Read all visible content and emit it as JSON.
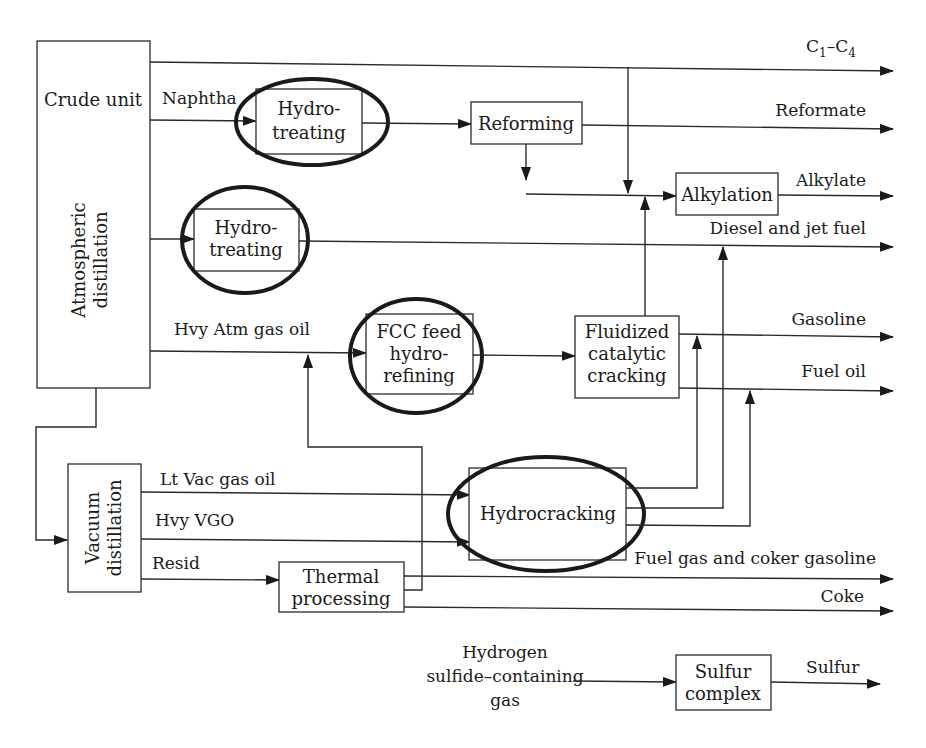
{
  "diagram": {
    "units": {
      "crude_unit": {
        "label": "Crude unit"
      },
      "atmospheric_distillation": {
        "label_line1": "Atmospheric",
        "label_line2": "distillation"
      },
      "naphtha_hydrotreating": {
        "label_line1": "Hydro-",
        "label_line2": "treating",
        "highlighted": true
      },
      "distillate_hydrotreating": {
        "label_line1": "Hydro-",
        "label_line2": "treating",
        "highlighted": true
      },
      "reforming": {
        "label": "Reforming"
      },
      "alkylation": {
        "label": "Alkylation"
      },
      "fcc_feed_hydrorefining": {
        "label_line1": "FCC feed",
        "label_line2": "hydro-",
        "label_line3": "refining",
        "highlighted": true
      },
      "fcc": {
        "label_line1": "Fluidized",
        "label_line2": "catalytic",
        "label_line3": "cracking"
      },
      "vacuum_distillation": {
        "label_line1": "Vacuum",
        "label_line2": "distillation"
      },
      "hydrocracking": {
        "label": "Hydrocracking",
        "highlighted": true
      },
      "thermal_processing": {
        "label_line1": "Thermal",
        "label_line2": "processing"
      },
      "sulfur_complex": {
        "label_line1": "Sulfur",
        "label_line2": "complex"
      }
    },
    "streams": {
      "naphtha": "Naphtha",
      "hvy_atm_gas_oil": "Hvy Atm gas oil",
      "lt_vac_gas_oil": "Lt Vac gas oil",
      "hvy_vgo": "Hvy VGO",
      "resid": "Resid",
      "h2s_gas_line1": "Hydrogen",
      "h2s_gas_line2": "sulfide–containing",
      "h2s_gas_line3": "gas"
    },
    "products": {
      "c1_c4_base": "C",
      "c1_c4_sub1": "1",
      "c1_c4_dash": "–C",
      "c1_c4_sub2": "4",
      "reformate": "Reformate",
      "alkylate": "Alkylate",
      "diesel_jet": "Diesel and jet fuel",
      "gasoline": "Gasoline",
      "fuel_oil": "Fuel oil",
      "fuel_gas_coker": "Fuel gas and coker gasoline",
      "coke": "Coke",
      "sulfur": "Sulfur"
    },
    "colors": {
      "line": "#2a2a2a",
      "highlight_ring": "#1a1a1a",
      "background": "#ffffff"
    }
  }
}
